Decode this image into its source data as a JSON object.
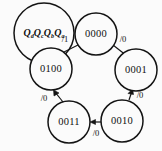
{
  "diagram": {
    "type": "state-transition-diagram",
    "background_color": "#fbfbfb",
    "line_color": "#141414",
    "legend": {
      "name": "state-bit-order-legend",
      "parts": [
        {
          "base": "Q",
          "sub": "d"
        },
        {
          "base": "Q",
          "sub": "c"
        },
        {
          "base": "Q",
          "sub": "b"
        },
        {
          "base": "Q",
          "sub": "a"
        }
      ],
      "text": "QdQcQbQa",
      "cx": 44,
      "cy": 33,
      "r": 30
    },
    "states": [
      {
        "id": "s0000",
        "label": "0000",
        "cx": 96,
        "cy": 34,
        "r": 21
      },
      {
        "id": "s0001",
        "label": "0001",
        "cx": 136,
        "cy": 70,
        "r": 21
      },
      {
        "id": "s0010",
        "label": "0010",
        "cx": 122,
        "cy": 121,
        "r": 21
      },
      {
        "id": "s0011",
        "label": "0011",
        "cx": 69,
        "cy": 122,
        "r": 21
      },
      {
        "id": "s0100",
        "label": "0100",
        "cx": 51,
        "cy": 69,
        "r": 21
      }
    ],
    "transitions": [
      {
        "id": "t-0100-0000",
        "from": "s0100",
        "to": "s0000",
        "label": "/1",
        "x1": 62,
        "y1": 53,
        "x2": 82,
        "y2": 43,
        "lx": 65,
        "ly": 40
      },
      {
        "id": "t-0000-0001",
        "from": "s0000",
        "to": "s0001",
        "label": "/0",
        "x1": 113,
        "y1": 46,
        "x2": 127,
        "y2": 55,
        "lx": 122,
        "ly": 40
      },
      {
        "id": "t-0001-0010",
        "from": "s0001",
        "to": "s0010",
        "label": "/0",
        "x1": 131,
        "y1": 91,
        "x2": 126,
        "y2": 100,
        "lx": 139,
        "ly": 95
      },
      {
        "id": "t-0010-0011",
        "from": "s0010",
        "to": "s0011",
        "label": "/0",
        "x1": 101,
        "y1": 122,
        "x2": 91,
        "y2": 122,
        "lx": 95,
        "ly": 134
      },
      {
        "id": "t-0011-0100",
        "from": "s0011",
        "to": "s0100",
        "label": "/0",
        "x1": 62,
        "y1": 101,
        "x2": 54,
        "y2": 91,
        "lx": 44,
        "ly": 98
      }
    ]
  }
}
